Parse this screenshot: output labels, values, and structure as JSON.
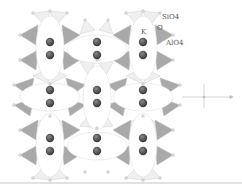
{
  "figure": {
    "labels": {
      "sio4": "SiO4",
      "o": "O",
      "k": "K",
      "alo4": "AlO4"
    },
    "colors": {
      "k_atom": "#555555",
      "alo4_tetra": "#a8a8a8",
      "sio4_tetra": "#ececec",
      "cage_ellipse": "#ffffff",
      "edge": "#c8c8c8"
    },
    "k_columns_x": [
      50,
      97,
      143
    ],
    "cage_rows": [
      {
        "y": 50,
        "vertical_cages_x": [
          50,
          143
        ],
        "horizontal_cage_x": 97
      },
      {
        "y": 100,
        "vertical_cages_x": [
          97
        ],
        "horizontal_cages_x": [
          50,
          143
        ]
      },
      {
        "y": 143,
        "vertical_cages_x": [
          50,
          143
        ],
        "horizontal_cage_x": 97
      }
    ]
  }
}
